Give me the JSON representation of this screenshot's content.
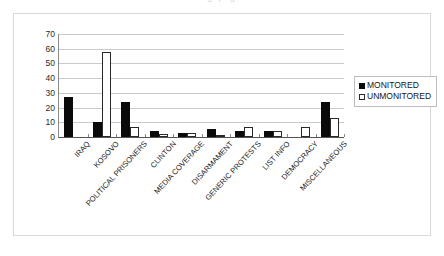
{
  "title_remnant": "g p g",
  "chart_data": {
    "type": "bar",
    "title": "",
    "xlabel": "",
    "ylabel": "",
    "ylim": [
      0,
      70
    ],
    "yticks": [
      0,
      10,
      20,
      30,
      40,
      50,
      60,
      70
    ],
    "grid": true,
    "legend_position": "right",
    "categories": [
      "IRAQ",
      "KOSOVO",
      "POLITICAL PRISONERS",
      "CLINTON",
      "MEDIA COVERAGE",
      "DISARMAMENT",
      "GENERIC PROTESTS",
      "LIST INFO",
      "DEMOCRACY",
      "MISCELLANEOUS"
    ],
    "series": [
      {
        "name": "MONITORED",
        "color": "#0a0a0a",
        "values": [
          27,
          10,
          24,
          4,
          2.5,
          5.5,
          4,
          4,
          0,
          23.5
        ]
      },
      {
        "name": "UNMONITORED",
        "color": "#ffffff",
        "values": [
          0,
          58,
          7,
          2,
          2.5,
          1.5,
          7,
          4,
          7,
          13
        ]
      }
    ]
  },
  "legend": {
    "items": [
      {
        "label": "MONITORED",
        "style": "fill"
      },
      {
        "label": "UNMONITORED",
        "style": "open"
      }
    ]
  }
}
